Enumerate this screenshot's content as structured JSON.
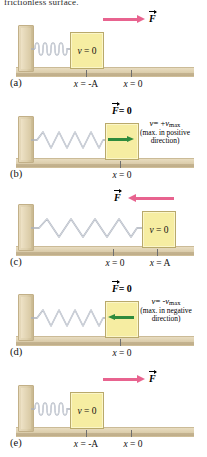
{
  "figure": {
    "cut_caption": "frictionless surface.",
    "symbols": {
      "force": "F",
      "velocity": "v",
      "zero": "= 0",
      "force_zero": "= 0"
    }
  },
  "panels": [
    {
      "letter": "(a)",
      "spring_state": "compressed",
      "block_label_var": "v",
      "block_label_eq": "= 0",
      "force": {
        "label": "F",
        "direction": "right",
        "magnitude_text": "",
        "visible": true
      },
      "velocity_arrow": {
        "visible": false,
        "direction": "right"
      },
      "velocity_text": null,
      "positions": [
        {
          "text_var": "x",
          "text_eq": "= -A"
        },
        {
          "text_var": "x",
          "text_eq": "= 0"
        }
      ]
    },
    {
      "letter": "(b)",
      "spring_state": "natural",
      "block_label_var": "",
      "block_label_eq": "",
      "force": {
        "label": "F",
        "direction": "none",
        "magnitude_text": "= 0",
        "visible": false
      },
      "velocity_arrow": {
        "visible": true,
        "direction": "right"
      },
      "velocity_text": {
        "var": "v",
        "eq": "= +",
        "vsym": "v",
        "sub": "max",
        "note_line1": "(max. in positive",
        "note_line2": "direction)"
      },
      "positions": [
        {
          "text_var": "x",
          "text_eq": "= 0"
        }
      ]
    },
    {
      "letter": "(c)",
      "spring_state": "stretched",
      "block_label_var": "v",
      "block_label_eq": "= 0",
      "force": {
        "label": "F",
        "direction": "left",
        "magnitude_text": "",
        "visible": true
      },
      "velocity_arrow": {
        "visible": false,
        "direction": "left"
      },
      "velocity_text": null,
      "positions": [
        {
          "text_var": "x",
          "text_eq": "= 0"
        },
        {
          "text_var": "x",
          "text_eq": "= A"
        }
      ]
    },
    {
      "letter": "(d)",
      "spring_state": "natural",
      "block_label_var": "",
      "block_label_eq": "",
      "force": {
        "label": "F",
        "direction": "none",
        "magnitude_text": "= 0",
        "visible": false
      },
      "velocity_arrow": {
        "visible": true,
        "direction": "left"
      },
      "velocity_text": {
        "var": "v",
        "eq": "= -",
        "vsym": "v",
        "sub": "max",
        "note_line1": "(max. in negative",
        "note_line2": "direction)"
      },
      "positions": [
        {
          "text_var": "x",
          "text_eq": "= 0"
        }
      ]
    },
    {
      "letter": "(e)",
      "spring_state": "compressed",
      "block_label_var": "v",
      "block_label_eq": "= 0",
      "force": {
        "label": "F",
        "direction": "right",
        "magnitude_text": "",
        "visible": true
      },
      "velocity_arrow": {
        "visible": false,
        "direction": "right"
      },
      "velocity_text": null,
      "positions": [
        {
          "text_var": "x",
          "text_eq": "= -A"
        },
        {
          "text_var": "x",
          "text_eq": "= 0"
        }
      ]
    }
  ],
  "colors": {
    "force_arrow": "#e8638f",
    "velocity_arrow": "#2e8b3d",
    "block_fill": "#f6eda2",
    "block_border": "#b9a96b",
    "ground": "#ddcfae",
    "spring": "#c9ccd4"
  }
}
